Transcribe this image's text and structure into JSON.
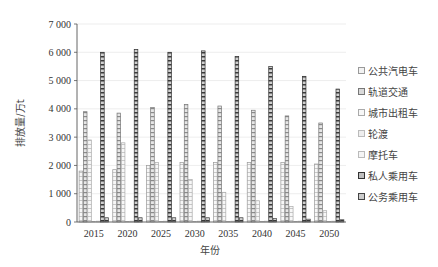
{
  "chart_data": {
    "type": "bar",
    "title": "",
    "xlabel": "年份",
    "ylabel": "排放量/万t",
    "ylim": [
      0,
      7000
    ],
    "yticks": [
      0,
      1000,
      2000,
      3000,
      4000,
      5000,
      6000,
      7000
    ],
    "ytick_labels": [
      "0",
      "1 000",
      "2 000",
      "3 000",
      "4 000",
      "5 000",
      "6 000",
      "7 000"
    ],
    "grid": true,
    "legend_position": "right",
    "categories": [
      "2015",
      "2020",
      "2025",
      "2030",
      "2035",
      "2040",
      "2045",
      "2050"
    ],
    "series": [
      {
        "name": "公共汽电车",
        "values": [
          1800,
          1850,
          2000,
          2100,
          2100,
          2100,
          2100,
          2050
        ],
        "color": "#f2f2f2",
        "stroke": "#999999",
        "pattern": "light"
      },
      {
        "name": "轨道交通",
        "values": [
          3900,
          3850,
          4050,
          4150,
          4100,
          3950,
          3750,
          3500
        ],
        "color": "#d9d9d9",
        "stroke": "#777777",
        "pattern": "medium"
      },
      {
        "name": "城市出租车",
        "values": [
          2900,
          2800,
          2100,
          1500,
          1050,
          750,
          550,
          400
        ],
        "color": "#f7f7f7",
        "stroke": "#aaaaaa",
        "pattern": "light"
      },
      {
        "name": "轮渡",
        "values": [
          20,
          20,
          20,
          20,
          20,
          20,
          20,
          20
        ],
        "color": "#eeeeee",
        "stroke": "#bbbbbb",
        "pattern": "faint"
      },
      {
        "name": "摩托车",
        "values": [
          30,
          30,
          30,
          30,
          30,
          30,
          30,
          30
        ],
        "color": "#f5f5f5",
        "stroke": "#bbbbbb",
        "pattern": "faint"
      },
      {
        "name": "私人乘用车",
        "values": [
          6000,
          6100,
          6000,
          6050,
          5850,
          5500,
          5150,
          4700
        ],
        "color": "#bfbfbf",
        "stroke": "#333333",
        "pattern": "dark"
      },
      {
        "name": "公务乘用车",
        "values": [
          150,
          150,
          150,
          150,
          150,
          120,
          100,
          80
        ],
        "color": "#cccccc",
        "stroke": "#444444",
        "pattern": "dark"
      }
    ]
  },
  "legend": {
    "items": [
      {
        "label": "公共汽电车"
      },
      {
        "label": "轨道交通"
      },
      {
        "label": "城市出租车"
      },
      {
        "label": "轮渡"
      },
      {
        "label": "摩托车"
      },
      {
        "label": "私人乘用车"
      },
      {
        "label": "公务乘用车"
      }
    ]
  }
}
